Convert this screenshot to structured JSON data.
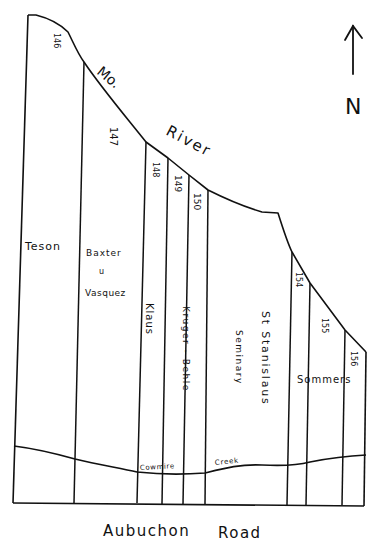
{
  "map": {
    "title": "Plat sketch along Missouri River and Aubuchon Road",
    "north_arrow": {
      "label": "N",
      "icon": "north-arrow-icon"
    },
    "river": {
      "label_part1": "Mo.",
      "label_part2": "River"
    },
    "road": {
      "label_part1": "Aubuchon",
      "label_part2": "Road"
    },
    "creek": {
      "label_part1": "Cowmire",
      "label_part2": "Creek"
    },
    "lots": [
      {
        "number": "146",
        "owner": "Teson"
      },
      {
        "number": "147",
        "owner_line1": "Baxter",
        "owner_line2": "u",
        "owner_line3": "Vasquez"
      },
      {
        "number": "148",
        "owner": "Klaus"
      },
      {
        "number": "149",
        "owner": "Kruger - Behle"
      },
      {
        "number": "150",
        "owner": ""
      },
      {
        "number": "151",
        "owner_line1": "St Stanislaus",
        "owner_line2": "Seminary"
      },
      {
        "number": "154",
        "owner": "Sommers"
      },
      {
        "number": "155",
        "owner": ""
      },
      {
        "number": "156",
        "owner": ""
      }
    ]
  }
}
